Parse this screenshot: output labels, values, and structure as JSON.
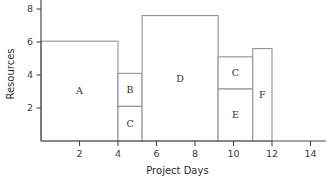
{
  "chart_data": {
    "type": "bar",
    "title": "",
    "subtitle": "",
    "xlabel": "Project Days",
    "ylabel": "Resources",
    "xlim": [
      0,
      14.8
    ],
    "ylim": [
      0,
      8.6
    ],
    "grid": false,
    "legend": null,
    "x_ticks": [
      2,
      4,
      6,
      8,
      10,
      12,
      14
    ],
    "x_tick_labels": [
      "2",
      "4",
      "6",
      "8",
      "10",
      "12",
      "14"
    ],
    "y_ticks": [
      2,
      4,
      6,
      8
    ],
    "y_tick_labels": [
      "2",
      "4",
      "6",
      "8"
    ],
    "note": "Resource histogram / loading diagram: stacked activity blocks over project days",
    "blocks": [
      {
        "label": "A",
        "x_start": 0.0,
        "x_end": 4.0,
        "y_start": 0.0,
        "y_end": 6.05
      },
      {
        "label": "B",
        "x_start": 4.0,
        "x_end": 5.25,
        "y_start": 2.1,
        "y_end": 4.1
      },
      {
        "label": "C",
        "x_start": 4.0,
        "x_end": 5.25,
        "y_start": 0.0,
        "y_end": 2.1
      },
      {
        "label": "D",
        "x_start": 5.25,
        "x_end": 9.2,
        "y_start": 0.0,
        "y_end": 7.6
      },
      {
        "label": "C",
        "x_start": 9.2,
        "x_end": 11.0,
        "y_start": 3.15,
        "y_end": 5.1
      },
      {
        "label": "E",
        "x_start": 9.2,
        "x_end": 11.0,
        "y_start": 0.0,
        "y_end": 3.15
      },
      {
        "label": "F",
        "x_start": 11.0,
        "x_end": 12.0,
        "y_start": 0.0,
        "y_end": 5.6
      }
    ],
    "colors": {
      "axis": "#4a4a4a",
      "block_stroke": "#8e8e8e",
      "block_fill": "#ffffff",
      "text": "#2e2e2e",
      "background": "#ffffff"
    }
  }
}
